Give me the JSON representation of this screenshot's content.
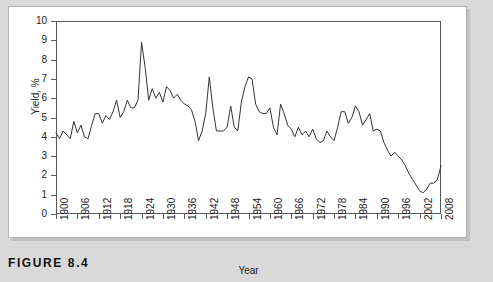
{
  "figure": {
    "caption": "FIGURE 8.4",
    "panel_background": "#ffffff",
    "page_background": "#d9d9d9"
  },
  "chart_data": {
    "type": "line",
    "title": "",
    "xlabel": "Year",
    "ylabel": "Yield, %",
    "xlim": [
      1900,
      2008
    ],
    "ylim": [
      0,
      10
    ],
    "grid": false,
    "legend": false,
    "line_color": "#333333",
    "xticks": [
      1900,
      1906,
      1912,
      1918,
      1924,
      1930,
      1936,
      1942,
      1948,
      1954,
      1960,
      1966,
      1972,
      1978,
      1984,
      1990,
      1996,
      2002,
      2008
    ],
    "yticks": [
      0,
      1,
      2,
      3,
      4,
      5,
      6,
      7,
      8,
      9,
      10
    ],
    "series": [
      {
        "name": "Yield",
        "x": [
          1900,
          1901,
          1902,
          1903,
          1904,
          1905,
          1906,
          1907,
          1908,
          1909,
          1910,
          1911,
          1912,
          1913,
          1914,
          1915,
          1916,
          1917,
          1918,
          1919,
          1920,
          1921,
          1922,
          1923,
          1924,
          1925,
          1926,
          1927,
          1928,
          1929,
          1930,
          1931,
          1932,
          1933,
          1934,
          1935,
          1936,
          1937,
          1938,
          1939,
          1940,
          1941,
          1942,
          1943,
          1944,
          1945,
          1946,
          1947,
          1948,
          1949,
          1950,
          1951,
          1952,
          1953,
          1954,
          1955,
          1956,
          1957,
          1958,
          1959,
          1960,
          1961,
          1962,
          1963,
          1964,
          1965,
          1966,
          1967,
          1968,
          1969,
          1970,
          1971,
          1972,
          1973,
          1974,
          1975,
          1976,
          1977,
          1978,
          1979,
          1980,
          1981,
          1982,
          1983,
          1984,
          1985,
          1986,
          1987,
          1988,
          1989,
          1990,
          1991,
          1992,
          1993,
          1994,
          1995,
          1996,
          1997,
          1998,
          1999,
          2000,
          2001,
          2002,
          2003,
          2004,
          2005,
          2006,
          2007,
          2008
        ],
        "values": [
          4.2,
          3.9,
          4.3,
          4.1,
          3.9,
          4.8,
          4.2,
          4.6,
          4.0,
          3.9,
          4.6,
          5.2,
          5.2,
          4.7,
          5.1,
          4.9,
          5.3,
          5.9,
          5.0,
          5.3,
          5.9,
          5.5,
          5.5,
          5.9,
          8.9,
          7.6,
          5.9,
          6.5,
          6.0,
          6.3,
          5.8,
          6.6,
          6.4,
          6.0,
          6.2,
          5.9,
          5.7,
          5.6,
          5.4,
          4.8,
          3.8,
          4.3,
          5.2,
          7.1,
          5.5,
          4.3,
          4.3,
          4.3,
          4.5,
          5.6,
          4.5,
          4.3,
          5.8,
          6.6,
          7.1,
          7.0,
          5.7,
          5.3,
          5.2,
          5.2,
          5.5,
          4.5,
          4.1,
          5.7,
          5.2,
          4.6,
          4.4,
          4.0,
          4.5,
          4.1,
          4.3,
          4.0,
          4.4,
          3.9,
          3.7,
          3.8,
          4.3,
          4.0,
          3.8,
          4.5,
          5.3,
          5.3,
          4.7,
          5.0,
          5.6,
          5.3,
          4.6,
          4.9,
          5.2,
          4.3,
          4.4,
          4.3,
          3.7,
          3.3,
          3.0,
          3.2,
          3.0,
          2.8,
          2.5,
          2.1,
          1.8,
          1.5,
          1.2,
          1.1,
          1.3,
          1.6,
          1.6,
          1.8,
          2.5
        ]
      }
    ]
  },
  "axes": {
    "y_label_text": "Yield, %",
    "x_label_text": "Year"
  }
}
